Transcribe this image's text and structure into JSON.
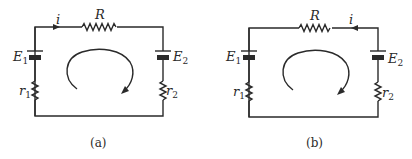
{
  "colors": {
    "ink": "#2a2a2a",
    "background": "#ffffff"
  },
  "figures": [
    {
      "id": "a",
      "caption": "(a)",
      "current_label": "i",
      "current_direction": "left-to-right",
      "resistor_label": "R",
      "emf_left": {
        "symbol": "E",
        "sub": "1"
      },
      "emf_right": {
        "symbol": "E",
        "sub": "2"
      },
      "internal_left": {
        "symbol": "r",
        "sub": "1"
      },
      "internal_right": {
        "symbol": "r",
        "sub": "2"
      },
      "loop_direction": "clockwise"
    },
    {
      "id": "b",
      "caption": "(b)",
      "current_label": "i",
      "current_direction": "right-to-left",
      "resistor_label": "R",
      "emf_left": {
        "symbol": "E",
        "sub": "1"
      },
      "emf_right": {
        "symbol": "E",
        "sub": "2"
      },
      "internal_left": {
        "symbol": "r",
        "sub": "1"
      },
      "internal_right": {
        "symbol": "r",
        "sub": "2"
      },
      "loop_direction": "clockwise"
    }
  ]
}
